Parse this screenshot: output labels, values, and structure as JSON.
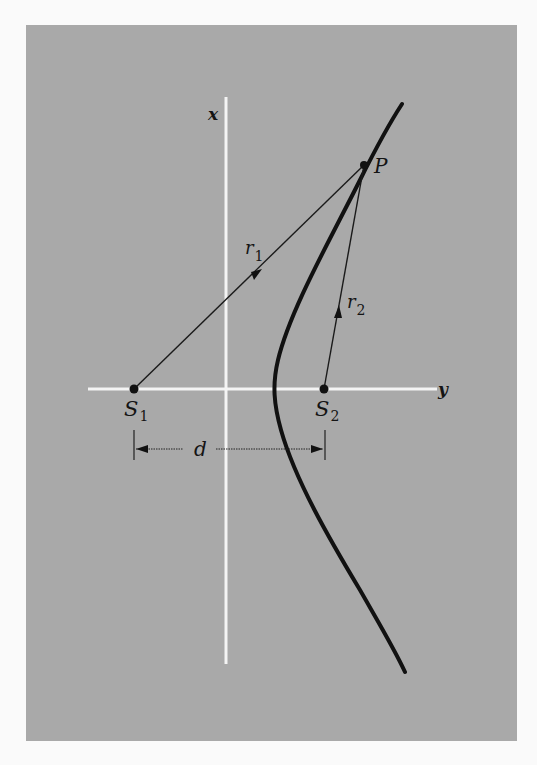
{
  "figure": {
    "background_color": "#a9a9a9",
    "axes": {
      "x_axis_label": "x",
      "y_axis_label": "y"
    },
    "points": {
      "P": {
        "label": "P"
      },
      "S1": {
        "label": "S",
        "subscript": "1"
      },
      "S2": {
        "label": "S",
        "subscript": "2"
      }
    },
    "vectors": {
      "r1": {
        "label": "r",
        "subscript": "1"
      },
      "r2": {
        "label": "r",
        "subscript": "2"
      }
    },
    "dimension": {
      "label": "d"
    }
  }
}
